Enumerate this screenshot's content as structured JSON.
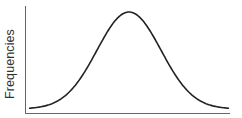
{
  "chart_data": {
    "type": "line",
    "title": "",
    "xlabel": "",
    "ylabel": "Frequencies",
    "series": [
      {
        "name": "normal distribution",
        "shape": "bell curve (Gaussian)",
        "mean_x": 0.5,
        "x": [
          0.0,
          0.1,
          0.2,
          0.3,
          0.4,
          0.5,
          0.6,
          0.7,
          0.8,
          0.9,
          1.0
        ],
        "values": [
          0.03,
          0.1,
          0.27,
          0.58,
          0.89,
          1.0,
          0.89,
          0.58,
          0.27,
          0.1,
          0.03
        ]
      }
    ],
    "xlim": [
      0,
      1
    ],
    "ylim": [
      0,
      1.1
    ],
    "grid": false,
    "legend": "none",
    "ticks": "none"
  },
  "colors": {
    "curve": "#222222",
    "axis": "#555555",
    "background": "#ffffff"
  }
}
